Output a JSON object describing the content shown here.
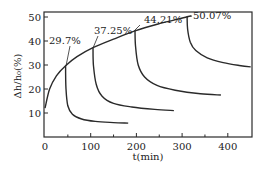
{
  "chart_data": {
    "type": "line",
    "title": "",
    "xlabel": "t(min)",
    "ylabel": "Δh/h₀(%)",
    "xlim": [
      0,
      450
    ],
    "ylim": [
      0,
      52
    ],
    "xticks": [
      0,
      100,
      200,
      300,
      400
    ],
    "xtick_labels": [
      "0",
      "100",
      "200",
      "300",
      "400"
    ],
    "yticks": [
      10,
      20,
      30,
      40,
      50
    ],
    "ytick_labels": [
      "10",
      "20",
      "30",
      "40",
      "50"
    ],
    "grid": false,
    "legend": null,
    "series": [
      {
        "name": "loading envelope",
        "x": [
          0,
          10,
          25,
          45,
          70,
          105,
          150,
          197,
          250,
          311,
          320
        ],
        "y": [
          12,
          20,
          25.5,
          29.7,
          33.5,
          37.25,
          40.8,
          44.21,
          47.2,
          50.07,
          50.5
        ]
      },
      {
        "name": "29.7%",
        "x": [
          45,
          46,
          50,
          60,
          80,
          110,
          150,
          182
        ],
        "y": [
          29.7,
          20,
          13,
          9.5,
          7.5,
          6.5,
          6,
          5.8
        ]
      },
      {
        "name": "37.25%",
        "x": [
          105,
          106,
          112,
          125,
          150,
          190,
          240,
          282
        ],
        "y": [
          37.25,
          30,
          22,
          17,
          14,
          12.5,
          11.5,
          11
        ]
      },
      {
        "name": "44.21%",
        "x": [
          197,
          198,
          204,
          218,
          245,
          285,
          340,
          385
        ],
        "y": [
          44.21,
          38,
          30,
          25,
          21.5,
          19.5,
          18,
          17.5
        ]
      },
      {
        "name": "50.07%",
        "x": [
          311,
          312,
          318,
          330,
          355,
          390,
          425,
          450
        ],
        "y": [
          50.07,
          45,
          39.5,
          36,
          33,
          31,
          29.8,
          29.2
        ]
      }
    ],
    "annotations": [
      {
        "text": "29.7%",
        "x": 45,
        "y": 29.7
      },
      {
        "text": "37.25%",
        "x": 105,
        "y": 37.25
      },
      {
        "text": "44.21%",
        "x": 197,
        "y": 44.21
      },
      {
        "text": "50.07%",
        "x": 311,
        "y": 50.07
      }
    ]
  }
}
